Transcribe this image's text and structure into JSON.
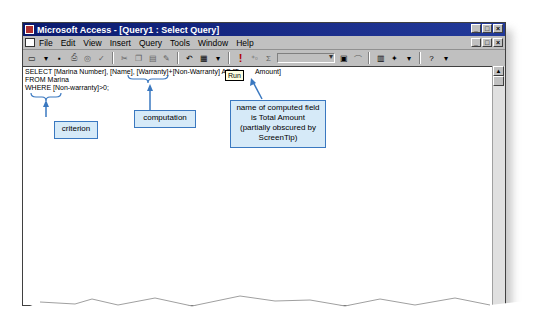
{
  "window": {
    "title": "Microsoft Access - [Query1 : Select Query]",
    "controls": [
      "_",
      "□",
      "×"
    ]
  },
  "menubar": {
    "items": [
      "File",
      "Edit",
      "View",
      "Insert",
      "Query",
      "Tools",
      "Window",
      "Help"
    ]
  },
  "toolbar": {
    "tooltip": "Run"
  },
  "sql": {
    "line1": "SELECT [Marina Number], [Name], [Warranty]+[Non-Warranty] AS [T",
    "line1_after": "Amount]",
    "line2": "FROM Marina",
    "line3": "WHERE [Non-warranty]>0;"
  },
  "callouts": {
    "criterion": "criterion",
    "computation": "computation",
    "computed_field": "name of computed field is Total Amount (partially obscured by ScreenTip)"
  },
  "colors": {
    "titlebar": "#0a1a6e",
    "callout_border": "#3a78c0",
    "callout_fill": "#d6eaf8",
    "tooltip": "#ffffe1"
  }
}
